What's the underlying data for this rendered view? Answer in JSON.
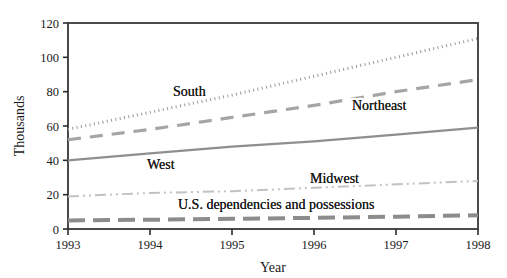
{
  "chart_data": {
    "type": "line",
    "title": "",
    "xlabel": "Year",
    "ylabel": "Thousands",
    "x": [
      1993,
      1994,
      1995,
      1996,
      1997,
      1998
    ],
    "xtick_labels": [
      "1993",
      "1994",
      "1995",
      "1996",
      "1997",
      "1998"
    ],
    "ytick_labels": [
      "0",
      "20",
      "40",
      "60",
      "80",
      "100",
      "120"
    ],
    "yticks": [
      0,
      20,
      40,
      60,
      80,
      100,
      120
    ],
    "xlim": [
      1993,
      1998
    ],
    "ylim": [
      0,
      120
    ],
    "grid": false,
    "legend_position": "inline-annotations",
    "series": [
      {
        "name": "South",
        "values": [
          58,
          68,
          78,
          89,
          100,
          111
        ],
        "color": "#9a9a9a",
        "line_style": "dotted",
        "line_width": 3,
        "dash_array": "1,3.4",
        "label_x": 173,
        "label_y": 96
      },
      {
        "name": "Northeast",
        "values": [
          52,
          58,
          65,
          72,
          80,
          87
        ],
        "color": "#a5a5a5",
        "line_style": "long-dashed",
        "line_width": 3.2,
        "dash_array": "13,9",
        "label_x": 352,
        "label_y": 110
      },
      {
        "name": "West",
        "values": [
          40,
          44,
          48,
          51,
          55,
          59
        ],
        "color": "#8f8f8f",
        "line_style": "solid",
        "line_width": 2.2,
        "dash_array": "",
        "label_x": 147,
        "label_y": 169
      },
      {
        "name": "Midwest",
        "values": [
          19,
          21,
          22,
          24,
          26,
          28
        ],
        "color": "#c2c2c2",
        "line_style": "dash-dot-dot",
        "line_width": 2,
        "dash_array": "11,4,2,4,2,4",
        "label_x": 310,
        "label_y": 183
      },
      {
        "name": "U.S. dependencies and possessions",
        "values": [
          5,
          5.4,
          5.9,
          6.5,
          7.2,
          8
        ],
        "color": "#8c8c8c",
        "line_style": "dashed-thick",
        "line_width": 4,
        "dash_array": "17,8",
        "label_x": 178,
        "label_y": 209
      }
    ]
  },
  "axes": {
    "frame_color": "#4a4a4a",
    "tick_color": "#2b2b2b",
    "plot_left": 68,
    "plot_right": 478,
    "plot_top": 23,
    "plot_bottom": 229
  }
}
